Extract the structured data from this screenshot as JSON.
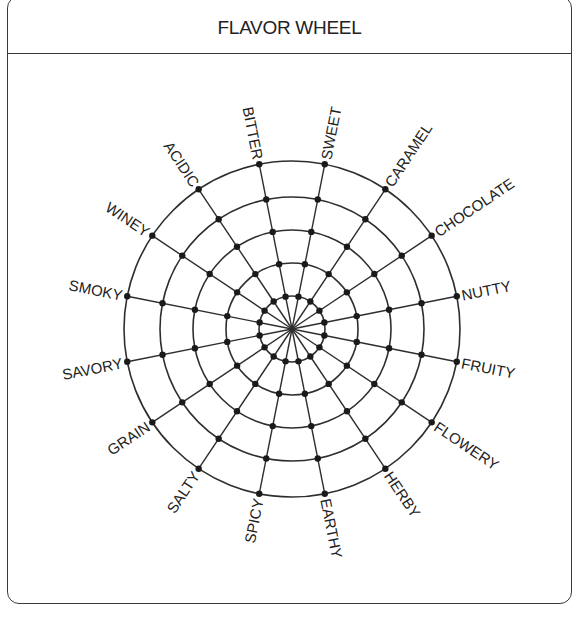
{
  "header": {
    "title": "FLAVOR WHEEL"
  },
  "wheel": {
    "center": [
      292,
      329
    ],
    "ring_radii": [
      33,
      66,
      99,
      132,
      168
    ],
    "start_angle_deg": -11.25,
    "step_deg": 22.5,
    "line_color": "#2e2e2e",
    "dot_color": "#1a1a1a",
    "labels": [
      "BITTER",
      "SWEET",
      "CARAMEL",
      "CHOCOLATE",
      "NUTTY",
      "FRUITY",
      "FLOWERY",
      "HERBY",
      "EARTHY",
      "SPICY",
      "SALTY",
      "GRAIN",
      "SAVORY",
      "SMOKY",
      "WINEY",
      "ACIDIC"
    ]
  }
}
